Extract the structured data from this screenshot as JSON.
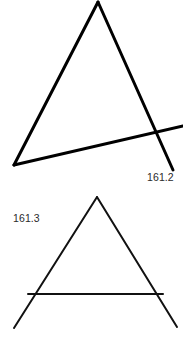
{
  "page": {
    "background_color": "#ffffff",
    "width": 183,
    "height": 339
  },
  "figures": {
    "upper": {
      "name": "upper-triangle-with-transversal",
      "stroke_color": "#000000",
      "stroke_width": 3,
      "label": "161.2",
      "apex": [
        98,
        2
      ],
      "left_vertex": [
        14,
        165
      ],
      "right_leg_end": [
        173,
        170
      ],
      "transversal_start": [
        14,
        165
      ],
      "transversal_end": [
        183,
        126
      ],
      "intersection": [
        165,
        132
      ]
    },
    "lower": {
      "name": "lower-triangle-with-crossbar",
      "stroke_color": "#111111",
      "stroke_width": 2,
      "label": "161.3",
      "apex": [
        97,
        197
      ],
      "left_leg_end": [
        14,
        328
      ],
      "right_leg_end": [
        177,
        327
      ],
      "crossbar_start": [
        28,
        294
      ],
      "crossbar_end": [
        163,
        294
      ]
    }
  },
  "labels": {
    "upper_value": "161.2",
    "lower_value": "161.3"
  }
}
